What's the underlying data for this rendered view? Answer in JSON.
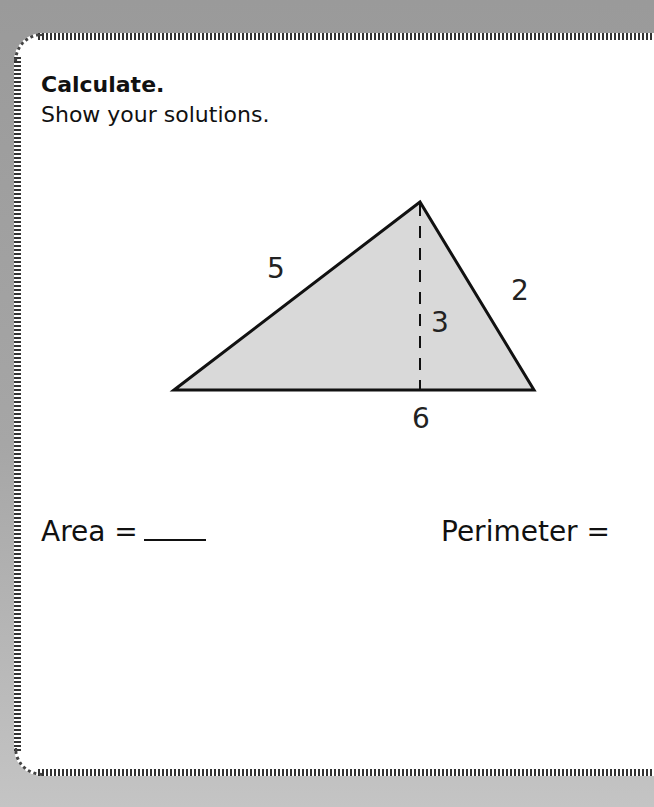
{
  "worksheet": {
    "title": "Calculate.",
    "instruction": "Show your solutions."
  },
  "figure": {
    "shape": "triangle",
    "fill_color": "#d9d9d9",
    "labels": {
      "left_side": "5",
      "right_side": "2",
      "height": "3",
      "base": "6"
    }
  },
  "questions": {
    "area_label": "Area =",
    "perimeter_label": "Perimeter ="
  }
}
